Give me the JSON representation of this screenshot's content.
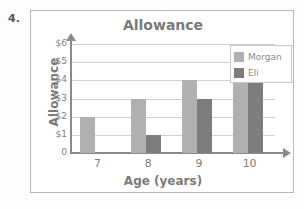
{
  "problem": {
    "number": "4."
  },
  "chart_data": {
    "type": "bar",
    "title": "Allowance",
    "xlabel": "Age (years)",
    "ylabel": "Allowance",
    "categories": [
      "7",
      "8",
      "9",
      "10"
    ],
    "series": [
      {
        "name": "Morgan",
        "color": "#b0b0b0",
        "values": [
          2,
          3,
          4,
          5
        ]
      },
      {
        "name": "Eli",
        "color": "#7d7d7d",
        "values": [
          0,
          1,
          3,
          5
        ]
      }
    ],
    "ylim": [
      0,
      6
    ],
    "yticks": [
      "0",
      "$1",
      "$2",
      "$3",
      "$4",
      "$5",
      "$6"
    ],
    "ytick_values": [
      0,
      1,
      2,
      3,
      4,
      5,
      6
    ],
    "grid": true,
    "legend_position": "top-right"
  }
}
